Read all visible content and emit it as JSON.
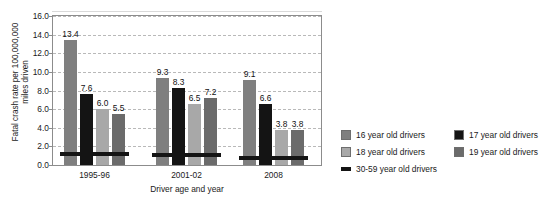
{
  "chart_data": {
    "type": "bar",
    "title": "",
    "xlabel": "Driver age and year",
    "ylabel": "Fatal crash rate per 100,000,000\nmiles driven",
    "categories": [
      "1995-96",
      "2001-02",
      "2008"
    ],
    "ylim": [
      0.0,
      16.0
    ],
    "ytick_step": 2.0,
    "yticks": [
      "0.0",
      "2.0",
      "4.0",
      "6.0",
      "8.0",
      "10.0",
      "12.0",
      "14.0",
      "16.0"
    ],
    "grid": true,
    "legend_position": "right",
    "series": [
      {
        "name": "16 year old drivers",
        "color": "#7f7f7f",
        "values": [
          13.4,
          9.3,
          9.1
        ],
        "labels": [
          "13.4",
          "9.3",
          "9.1"
        ]
      },
      {
        "name": "17 year old drivers",
        "color": "#141414",
        "values": [
          7.6,
          8.3,
          6.6
        ],
        "labels": [
          "7.6",
          "8.3",
          "6.6"
        ]
      },
      {
        "name": "18 year old drivers",
        "color": "#a8a8a8",
        "values": [
          6.0,
          6.5,
          3.8
        ],
        "labels": [
          "6.0",
          "6.5",
          "3.8"
        ]
      },
      {
        "name": "19 year old drivers",
        "color": "#6b6b6b",
        "values": [
          5.5,
          7.2,
          3.8
        ],
        "labels": [
          "5.5",
          "7.2",
          "3.8"
        ]
      },
      {
        "name": "30-59 year old drivers",
        "color": "#141414",
        "marker": "line",
        "values": [
          1.2,
          1.1,
          0.8
        ],
        "labels": [
          "",
          "",
          ""
        ]
      }
    ]
  },
  "legend": {
    "left_column": [
      {
        "label": "16 year old drivers",
        "swatch": "#7f7f7f",
        "marker": "square"
      },
      {
        "label": "18 year old drivers",
        "swatch": "#a8a8a8",
        "marker": "square"
      }
    ],
    "right_column": [
      {
        "label": "17 year old drivers",
        "swatch": "#141414",
        "marker": "square"
      },
      {
        "label": "19 year old drivers",
        "swatch": "#6b6b6b",
        "marker": "square"
      }
    ],
    "full_row": {
      "label": "30-59 year old drivers",
      "swatch": "#141414",
      "marker": "line"
    }
  }
}
